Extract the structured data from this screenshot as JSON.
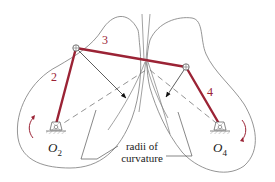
{
  "figure": {
    "colors": {
      "link": "#9b2335",
      "curve": "#7a7a7a",
      "construction": "#666666",
      "text": "#222222"
    },
    "links": [
      {
        "id": "2",
        "label": "2"
      },
      {
        "id": "3",
        "label": "3"
      },
      {
        "id": "4",
        "label": "4"
      }
    ],
    "ground_pivots": [
      {
        "id": "O2",
        "label_main": "O",
        "label_sub": "2"
      },
      {
        "id": "O4",
        "label_main": "O",
        "label_sub": "4"
      }
    ],
    "annotation": {
      "line1": "radii of",
      "line2": "curvature"
    }
  }
}
